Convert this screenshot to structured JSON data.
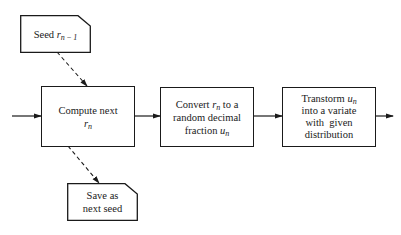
{
  "diagram": {
    "type": "flowchart",
    "nodes": {
      "seed": {
        "shape": "document-clipped-corner",
        "label_prefix": "Seed ",
        "var": "r",
        "sub": "n − 1"
      },
      "compute": {
        "shape": "rectangle",
        "line1": "Compute next",
        "var": "r",
        "sub": "n"
      },
      "convert": {
        "shape": "rectangle",
        "line1_prefix": "Convert ",
        "line1_var": "r",
        "line1_sub": "n",
        "line1_suffix": " to a",
        "line2": "random decimal",
        "line3_prefix": "fraction ",
        "line3_var": "u",
        "line3_sub": "n"
      },
      "transform": {
        "shape": "rectangle",
        "line1_prefix": "Transtorm ",
        "line1_var": "u",
        "line1_sub": "n",
        "line2": "into a variate",
        "line3": "with  given",
        "line4": "distribution"
      },
      "save": {
        "shape": "document-clipped-corner",
        "line1": "Save as",
        "line2": "next seed"
      }
    },
    "edges": [
      {
        "from": "input",
        "to": "compute",
        "style": "solid"
      },
      {
        "from": "seed",
        "to": "compute",
        "style": "dashed"
      },
      {
        "from": "compute",
        "to": "convert",
        "style": "solid"
      },
      {
        "from": "convert",
        "to": "transform",
        "style": "solid"
      },
      {
        "from": "transform",
        "to": "output",
        "style": "solid"
      },
      {
        "from": "compute",
        "to": "save",
        "style": "dashed"
      }
    ],
    "colors": {
      "stroke": "#1a1a1a",
      "background": "#ffffff"
    }
  }
}
